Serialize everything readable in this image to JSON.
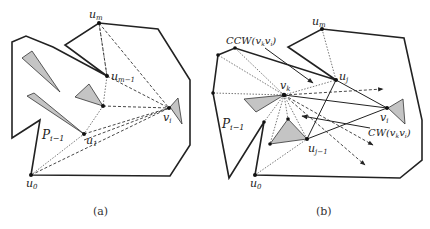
{
  "figure": {
    "panels": [
      {
        "id": "a",
        "caption": "(a)",
        "labels": {
          "u_m": "u",
          "u_m_sub": "m",
          "u_m1": "u",
          "u_m1_sub": "m−1",
          "u_1": "u",
          "u_1_sub": "1",
          "u_0": "u",
          "u_0_sub": "0",
          "v_i": "v",
          "v_i_sub": "i",
          "P": "P",
          "P_sub": "i−1"
        }
      },
      {
        "id": "b",
        "caption": "(b)",
        "labels": {
          "u_m": "u",
          "u_m_sub": "m",
          "u_j": "u",
          "u_j_sub": "j",
          "u_j1": "u",
          "u_j1_sub": "j−1",
          "u_0": "u",
          "u_0_sub": "0",
          "v_k": "v",
          "v_k_sub": "k",
          "v_i": "v",
          "v_i_sub": "i",
          "P": "P",
          "P_sub": "i−1",
          "ccw": "CCW(v",
          "ccw_sub1": "k",
          "ccw_mid": "v",
          "ccw_sub2": "i",
          "ccw_end": ")",
          "cw": "CW(v",
          "cw_sub1": "k",
          "cw_mid": "v",
          "cw_sub2": "i",
          "cw_end": ")"
        }
      }
    ],
    "colors": {
      "stroke": "#222222",
      "obstacle_fill": "#c4c4c4",
      "background": "#ffffff"
    }
  }
}
